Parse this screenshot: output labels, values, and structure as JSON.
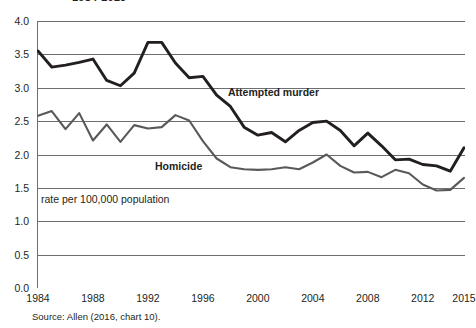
{
  "figure": {
    "title": "1984-2015",
    "source_note": "Source: Allen (2016, chart 10).",
    "axis_note": "rate per 100,000 population"
  },
  "chart_data": {
    "type": "line",
    "title": "1984-2015",
    "xlabel": "",
    "ylabel": "rate per 100,000 population",
    "ylim": [
      0.0,
      4.0
    ],
    "xlim": [
      1984,
      2015
    ],
    "grid": "horizontal",
    "legend": "inline-labels",
    "yticks": [
      "0.0",
      "0.5",
      "1.0",
      "1.5",
      "2.0",
      "2.5",
      "3.0",
      "3.5",
      "4.0"
    ],
    "ytick_values": [
      0.0,
      0.5,
      1.0,
      1.5,
      2.0,
      2.5,
      3.0,
      3.5,
      4.0
    ],
    "xticks": [
      "1984",
      "1988",
      "1992",
      "1996",
      "2000",
      "2004",
      "2008",
      "2012",
      "2015"
    ],
    "xtick_values": [
      1984,
      1988,
      1992,
      1996,
      2000,
      2004,
      2008,
      2012,
      2015
    ],
    "x": [
      1984,
      1985,
      1986,
      1987,
      1988,
      1989,
      1990,
      1991,
      1992,
      1993,
      1994,
      1995,
      1996,
      1997,
      1998,
      1999,
      2000,
      2001,
      2002,
      2003,
      2004,
      2005,
      2006,
      2007,
      2008,
      2009,
      2010,
      2011,
      2012,
      2013,
      2014,
      2015
    ],
    "series": [
      {
        "name": "Attempted murder",
        "color": "#231f20",
        "values": [
          3.55,
          3.31,
          3.34,
          3.38,
          3.43,
          3.11,
          3.03,
          3.22,
          3.68,
          3.68,
          3.37,
          3.15,
          3.17,
          2.89,
          2.72,
          2.41,
          2.29,
          2.33,
          2.19,
          2.36,
          2.48,
          2.5,
          2.36,
          2.13,
          2.32,
          2.13,
          1.92,
          1.93,
          1.85,
          1.83,
          1.75,
          2.1
        ]
      },
      {
        "name": "Homicide",
        "color": "#58595b",
        "values": [
          2.58,
          2.65,
          2.38,
          2.62,
          2.21,
          2.45,
          2.19,
          2.44,
          2.39,
          2.41,
          2.59,
          2.51,
          2.2,
          1.94,
          1.81,
          1.78,
          1.77,
          1.78,
          1.81,
          1.78,
          1.88,
          2.0,
          1.83,
          1.73,
          1.74,
          1.66,
          1.77,
          1.72,
          1.55,
          1.46,
          1.47,
          1.65
        ]
      }
    ]
  }
}
